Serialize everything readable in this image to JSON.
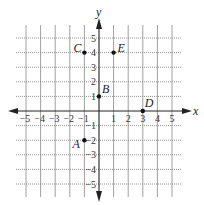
{
  "diagram": {
    "type": "coordinate-plane",
    "x_axis": {
      "label": "x",
      "min": -5,
      "max": 5,
      "ticks": [
        -5,
        -4,
        -3,
        -2,
        -1,
        1,
        2,
        3,
        4,
        5
      ]
    },
    "y_axis": {
      "label": "y",
      "min": -5,
      "max": 5,
      "ticks": [
        -5,
        -4,
        -3,
        -2,
        -1,
        1,
        2,
        3,
        4,
        5
      ]
    },
    "grid": {
      "vertical_style": "solid",
      "horizontal_style": "dotted"
    },
    "points": [
      {
        "label": "A",
        "x": -1,
        "y": -2
      },
      {
        "label": "B",
        "x": 0,
        "y": 1
      },
      {
        "label": "C",
        "x": -1,
        "y": 4
      },
      {
        "label": "D",
        "x": 3,
        "y": 0
      },
      {
        "label": "E",
        "x": 1,
        "y": 4
      }
    ],
    "colors": {
      "axis": "#222222",
      "grid": "#888888",
      "point": "#111111"
    }
  }
}
